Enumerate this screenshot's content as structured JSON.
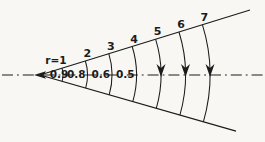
{
  "diagram": {
    "colors": {
      "background": "#f8f7f4",
      "ink": "#1c1c1c"
    },
    "centerline_style": "dash-dot",
    "vertex_marker": "left-arrowhead",
    "arcs": [
      {
        "top_label": "r=1",
        "center_label": "0.9",
        "marker": "none"
      },
      {
        "top_label": "2",
        "center_label": "0.8",
        "marker": "none"
      },
      {
        "top_label": "3",
        "center_label": "0.6",
        "marker": "none"
      },
      {
        "top_label": "4",
        "center_label": "0.5",
        "marker": "none"
      },
      {
        "top_label": "5",
        "center_label": "",
        "marker": "down-arrow"
      },
      {
        "top_label": "6",
        "center_label": "",
        "marker": "down-arrow"
      },
      {
        "top_label": "7",
        "center_label": "",
        "marker": "down-arrow"
      }
    ]
  }
}
